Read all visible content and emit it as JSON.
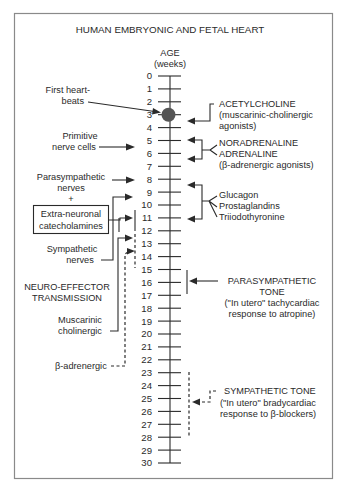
{
  "figure": {
    "title": "HUMAN EMBRYONIC AND FETAL HEART",
    "axis": {
      "label": "AGE",
      "unit": "(weeks)",
      "ticks": [
        "0",
        "1",
        "2",
        "3",
        "4",
        "5",
        "6",
        "7",
        "8",
        "9",
        "10",
        "11",
        "12",
        "13",
        "14",
        "15",
        "16",
        "17",
        "18",
        "19",
        "20",
        "21",
        "22",
        "23",
        "24",
        "25",
        "26",
        "27",
        "28",
        "29",
        "30"
      ]
    },
    "left_labels": {
      "first_heartbeats": [
        "First heart-",
        "beats"
      ],
      "primitive_nerve_cells": [
        "Primitive",
        "nerve cells"
      ],
      "parasympathetic_nerves": [
        "Parasympathetic",
        "nerves"
      ],
      "plus": "+",
      "extra_neuronal": [
        "Extra-neuronal",
        "catecholamines"
      ],
      "sympathetic_nerves": [
        "Sympathetic",
        "nerves"
      ],
      "neuro_effector": [
        "NEURO-EFFECTOR",
        "TRANSMISSION"
      ],
      "muscarinic": [
        "Muscarinic",
        "cholinergic"
      ],
      "beta_adrenergic": "β-adrenergic"
    },
    "right_labels": {
      "acetylcholine": [
        "ACETYLCHOLINE",
        "(muscarinic-cholinergic",
        "agonists)"
      ],
      "noradrenaline": [
        "NORADRENALINE",
        "ADRENALINE",
        "(β-adrenergic agonists)"
      ],
      "hormones": [
        "Glucagon",
        "Prostaglandins",
        "Triiodothyronine"
      ],
      "parasympathetic_tone": [
        "PARASYMPATHETIC",
        "TONE",
        "(\"In utero\" tachycardiac",
        "response to atropine)"
      ],
      "sympathetic_tone": [
        "SYMPATHETIC TONE",
        "(\"In utero\" bradycardiac",
        "response to β-blockers)"
      ]
    },
    "events_weeks": {
      "first_heartbeats": 3,
      "primitive_nerve_cells": 6,
      "parasympathetic_nerves": 8,
      "extra_neuronal_catecholamines": 11,
      "sympathetic_nerves": 10,
      "muscarinic_cholinergic_range": [
        10.5,
        14.5
      ],
      "beta_adrenergic": 14,
      "acetylcholine_response": 4,
      "noradrenaline_response": [
        5,
        6
      ],
      "hormone_response": [
        8,
        11
      ],
      "parasympathetic_tone_range": [
        15,
        17
      ],
      "sympathetic_tone_range": [
        23,
        28
      ]
    },
    "colors": {
      "ink": "#2a2a2a",
      "dot": "#555555",
      "frame": "#8a8a8a",
      "background": "#ffffff"
    }
  }
}
